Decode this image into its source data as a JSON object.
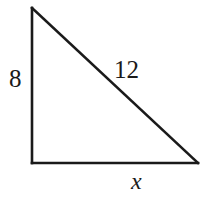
{
  "figure": {
    "kind": "right-triangle-diagram",
    "background_color": "#ffffff",
    "stroke_color": "#1a1a1a",
    "stroke_width": 2.6,
    "vertices": {
      "apex": {
        "x": 32,
        "y": 8
      },
      "bottom_left": {
        "x": 32,
        "y": 163
      },
      "bottom_right": {
        "x": 198,
        "y": 163
      }
    },
    "sides": [
      {
        "name": "vertical-leg",
        "from": "apex",
        "to": "bottom_left"
      },
      {
        "name": "horizontal-leg",
        "from": "bottom_left",
        "to": "bottom_right"
      },
      {
        "name": "hypotenuse",
        "from": "apex",
        "to": "bottom_right"
      }
    ]
  },
  "labels": {
    "vertical_leg": "8",
    "hypotenuse": "12",
    "horizontal_leg": "x"
  },
  "chart_data": {
    "type": "diagram",
    "title": "",
    "shape": "right triangle",
    "measures": [
      {
        "side": "vertical leg",
        "label": "8",
        "value": 8,
        "known": true
      },
      {
        "side": "hypotenuse",
        "label": "12",
        "value": 12,
        "known": true
      },
      {
        "side": "horizontal leg",
        "label": "x",
        "value": null,
        "known": false
      }
    ],
    "right_angle_at": "bottom-left vertex"
  }
}
